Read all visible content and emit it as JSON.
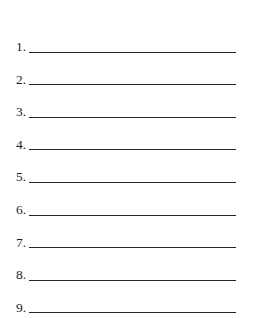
{
  "document": {
    "kind": "numbered-blank-list-worksheet",
    "background_color": "#ffffff",
    "ink_color": "#272727",
    "number_color": "#1b1b1b",
    "line_count": 9
  },
  "list": {
    "items": [
      {
        "number": "1.",
        "value": ""
      },
      {
        "number": "2.",
        "value": ""
      },
      {
        "number": "3.",
        "value": ""
      },
      {
        "number": "4.",
        "value": ""
      },
      {
        "number": "5.",
        "value": ""
      },
      {
        "number": "6.",
        "value": ""
      },
      {
        "number": "7.",
        "value": ""
      },
      {
        "number": "8.",
        "value": ""
      },
      {
        "number": "9.",
        "value": ""
      }
    ]
  }
}
